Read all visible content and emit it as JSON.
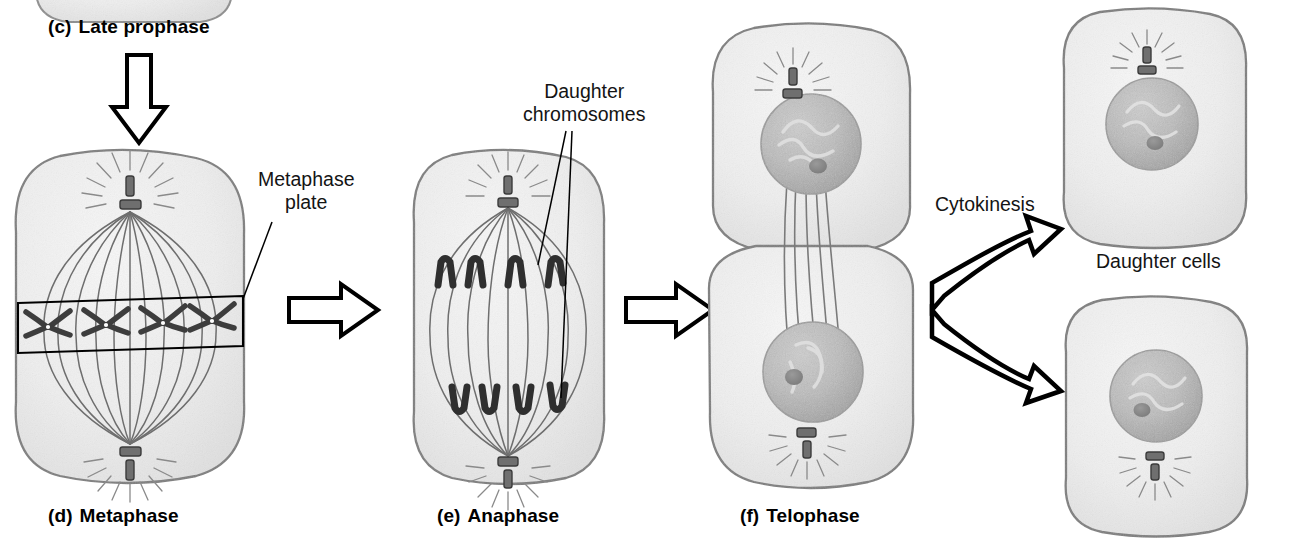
{
  "figure": {
    "background_color": "#ffffff",
    "ink_color": "#000000",
    "cytoplasm_color": "#efefef",
    "cytoplasm_edge_color": "#8d8d8d",
    "nucleus_color": "#b9b9b9",
    "nucleolus_color": "#8a8a8a",
    "chromosome_color": "#3a3a3a",
    "spindle_color": "#6e6e6e"
  },
  "stages": [
    {
      "id": "late-prophase",
      "letter": "(c)",
      "name": "Late prophase",
      "label_x": 48,
      "label_y": 16,
      "cropped": true
    },
    {
      "id": "metaphase",
      "letter": "(d)",
      "name": "Metaphase",
      "label_x": 48,
      "label_y": 505,
      "chromosome_count": 4,
      "spindle_fibers": 11,
      "centrioles": 2
    },
    {
      "id": "anaphase",
      "letter": "(e)",
      "name": "Anaphase",
      "label_x": 437,
      "label_y": 505,
      "chromosomes_top": 4,
      "chromosomes_bottom": 4,
      "spindle_fibers": 9,
      "centrioles": 2
    },
    {
      "id": "telophase",
      "letter": "(f)",
      "name": "Telophase",
      "label_x": 740,
      "label_y": 505,
      "cells": 2,
      "remnant_fibers": 5
    }
  ],
  "callouts": [
    {
      "id": "metaphase-plate",
      "lines": [
        "Metaphase",
        "plate"
      ],
      "x": 258,
      "y": 168
    },
    {
      "id": "daughter-chromosomes",
      "lines": [
        "Daughter",
        "chromosomes"
      ],
      "x": 523,
      "y": 80
    },
    {
      "id": "cytokinesis",
      "lines": [
        "Cytokinesis"
      ],
      "x": 935,
      "y": 193
    },
    {
      "id": "daughter-cells",
      "lines": [
        "Daughter cells"
      ],
      "x": 1096,
      "y": 250
    }
  ],
  "arrows": [
    {
      "id": "prophase-to-metaphase",
      "direction": "down",
      "icon": "arrow-down-icon"
    },
    {
      "id": "metaphase-to-anaphase",
      "direction": "right",
      "icon": "arrow-right-icon"
    },
    {
      "id": "anaphase-to-telophase",
      "direction": "right",
      "icon": "arrow-right-icon"
    },
    {
      "id": "telophase-to-daughter-cells",
      "direction": "fork",
      "icon": "arrow-fork-icon"
    }
  ],
  "daughter_cells": [
    {
      "id": "daughter-cell-top",
      "nucleus": true,
      "centriole_pair": true
    },
    {
      "id": "daughter-cell-bottom",
      "nucleus": true,
      "centriole_pair": true
    }
  ]
}
